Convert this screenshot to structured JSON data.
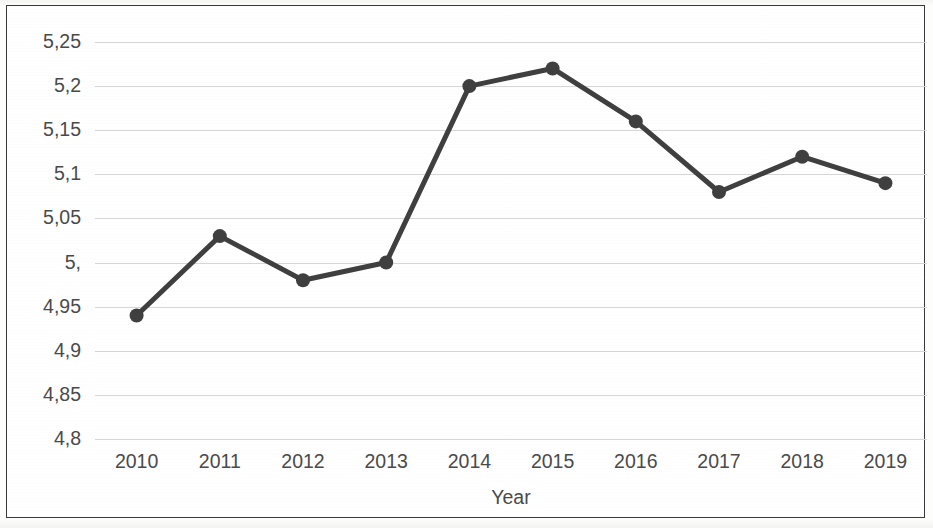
{
  "chart_data": {
    "type": "line",
    "title": "",
    "subtitle": "",
    "xlabel": "Year",
    "ylabel": "",
    "categories": [
      "2010",
      "2011",
      "2012",
      "2013",
      "2014",
      "2015",
      "2016",
      "2017",
      "2018",
      "2019"
    ],
    "values": [
      4.94,
      5.03,
      4.98,
      5.0,
      5.2,
      5.22,
      5.16,
      5.08,
      5.12,
      5.09
    ],
    "series": [
      {
        "name": "",
        "values": [
          4.94,
          5.03,
          4.98,
          5.0,
          5.2,
          5.22,
          5.16,
          5.08,
          5.12,
          5.09
        ]
      }
    ],
    "ylim": [
      4.8,
      5.25
    ],
    "ytick_values": [
      5.25,
      5.2,
      5.15,
      5.1,
      5.05,
      5.0,
      4.95,
      4.9,
      4.85,
      4.8
    ],
    "ytick_labels": [
      "5,25",
      "5,2",
      "5,15",
      "5,1",
      "5,05",
      "5,",
      "4,95",
      "4,9",
      "4,85",
      "4,8"
    ],
    "xtick_labels": [
      "2010",
      "2011",
      "2012",
      "2013",
      "2014",
      "2015",
      "2016",
      "2017",
      "2018",
      "2019"
    ],
    "decimal_separator": ",",
    "grid": true,
    "grid_axis": "y",
    "legend": false,
    "legend_position": "none",
    "markers": true,
    "marker_shape": "circle",
    "annotations": []
  },
  "style": {
    "line_color": "#3f3f3f",
    "marker_color": "#3f3f3f",
    "gridline_color": "#d6d6d6",
    "axis_text_color": "#4a4a4a",
    "frame_color": "#3a3a3a",
    "plot_background": "#ffffff",
    "line_width_px": 5,
    "marker_radius_px": 7
  }
}
